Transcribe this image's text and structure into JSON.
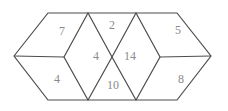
{
  "diagram": {
    "type": "geometric-figure",
    "colors": {
      "line": "#4d4d4d",
      "label": "#8a8a8a",
      "background": "#ffffff"
    },
    "regions": [
      {
        "name": "top-left-quad",
        "value": "7"
      },
      {
        "name": "top-center-triangle",
        "value": "2"
      },
      {
        "name": "top-right-quad",
        "value": "5"
      },
      {
        "name": "left-rhombus",
        "value": "4"
      },
      {
        "name": "right-rhombus",
        "value": "14"
      },
      {
        "name": "bottom-left-quad",
        "value": "4"
      },
      {
        "name": "bottom-center-triangle",
        "value": "10"
      },
      {
        "name": "bottom-right-quad",
        "value": "8"
      }
    ]
  }
}
